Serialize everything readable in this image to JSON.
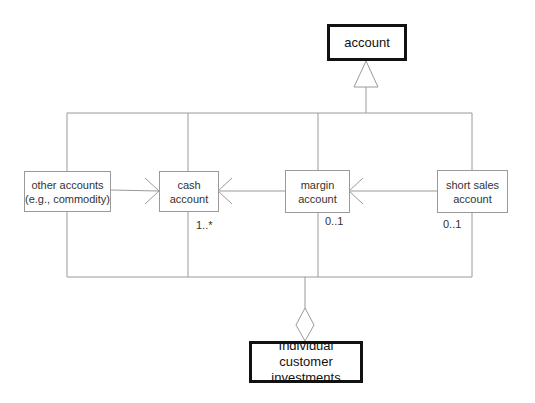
{
  "diagram": {
    "type": "UML class diagram",
    "classes": {
      "account": "account",
      "other": "other accounts (e.g.,  commodity)",
      "other_line1": "other accounts",
      "other_line2": "(e.g.,  commodity)",
      "cash_line1": "cash",
      "cash_line2": "account",
      "margin_line1": "margin",
      "margin_line2": "account",
      "short_line1": "short sales",
      "short_line2": "account",
      "investments_line1": "Individual customer",
      "investments_line2": "investments"
    },
    "multiplicities": {
      "cash": "1..*",
      "margin": "0..1",
      "short": "0..1"
    },
    "relationships": [
      {
        "from": "other accounts",
        "to": "cash account",
        "type": "association-arrow"
      },
      {
        "from": "margin account",
        "to": "cash account",
        "type": "association-arrow"
      },
      {
        "from": "short sales account",
        "to": "margin account",
        "type": "association-arrow"
      },
      {
        "from": "subclasses",
        "to": "account",
        "type": "generalization"
      },
      {
        "from": "subclasses",
        "to": "Individual customer investments",
        "type": "aggregation"
      }
    ],
    "colors": {
      "line": "#9a9a9a",
      "thick_border": "#111111"
    }
  }
}
